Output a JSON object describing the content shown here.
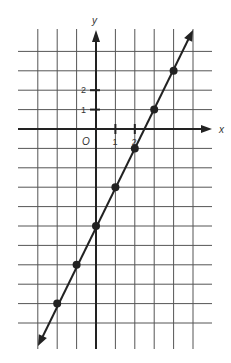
{
  "chart_data": {
    "type": "line",
    "title": "",
    "xlabel": "x",
    "ylabel": "y",
    "origin_label": "O",
    "x_ticks": [
      1,
      2
    ],
    "y_ticks": [
      1,
      2
    ],
    "xlim": [
      -3,
      5
    ],
    "ylim": [
      -11,
      4
    ],
    "grid": true,
    "equation": "y = 2x - 5",
    "series": [
      {
        "name": "line",
        "points": [
          {
            "x": -2,
            "y": -9
          },
          {
            "x": -1,
            "y": -7
          },
          {
            "x": 0,
            "y": -5
          },
          {
            "x": 1,
            "y": -3
          },
          {
            "x": 2,
            "y": -1
          },
          {
            "x": 3,
            "y": 1
          },
          {
            "x": 4,
            "y": 3
          }
        ]
      }
    ],
    "colors": {
      "grid": "#555555",
      "axis": "#222222",
      "line": "#222222",
      "points": "#222222"
    }
  }
}
